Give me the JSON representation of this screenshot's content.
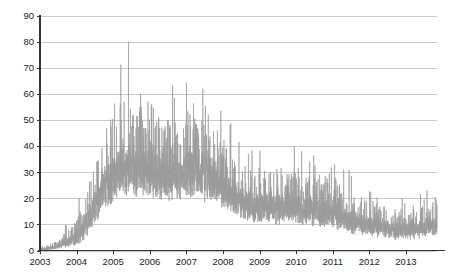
{
  "chart_data": {
    "type": "line",
    "title": "",
    "xlabel": "",
    "ylabel": "",
    "ylim": [
      0,
      90
    ],
    "xlim": [
      2003.0,
      2013.85
    ],
    "grid": true,
    "grid_axis": "y",
    "legend": "none",
    "series_color": "#9a9a9a",
    "axis_color": "#333333",
    "grid_color": "#c8c8c8",
    "background": "#ffffff",
    "y_ticks": [
      0,
      10,
      20,
      30,
      40,
      50,
      60,
      70,
      80,
      90
    ],
    "y_tick_labels": [
      "0",
      "10",
      "20",
      "30",
      "40",
      "50",
      "60",
      "70",
      "80",
      "90"
    ],
    "x_ticks": [
      2003,
      2004,
      2005,
      2006,
      2007,
      2008,
      2009,
      2010,
      2011,
      2012,
      2013
    ],
    "x_tick_labels": [
      "2003",
      "2004",
      "2005",
      "2006",
      "2007",
      "2008",
      "2009",
      "2010",
      "2011",
      "2012",
      "2013"
    ],
    "series": [
      {
        "name": "series-1",
        "color": "#9a9a9a",
        "description": "Dense noisy daily time series with sharp vertical spikes",
        "baseline": [
          {
            "x": 2003.0,
            "y": 0.3
          },
          {
            "x": 2003.2,
            "y": 0.6
          },
          {
            "x": 2003.4,
            "y": 1.2
          },
          {
            "x": 2003.6,
            "y": 2.0
          },
          {
            "x": 2003.8,
            "y": 3.2
          },
          {
            "x": 2004.0,
            "y": 5.0
          },
          {
            "x": 2004.2,
            "y": 8.0
          },
          {
            "x": 2004.4,
            "y": 13.0
          },
          {
            "x": 2004.6,
            "y": 19.0
          },
          {
            "x": 2004.8,
            "y": 24.0
          },
          {
            "x": 2005.0,
            "y": 27.0
          },
          {
            "x": 2005.2,
            "y": 29.0
          },
          {
            "x": 2005.4,
            "y": 30.0
          },
          {
            "x": 2005.6,
            "y": 30.0
          },
          {
            "x": 2005.8,
            "y": 29.5
          },
          {
            "x": 2006.0,
            "y": 29.0
          },
          {
            "x": 2006.2,
            "y": 28.0
          },
          {
            "x": 2006.4,
            "y": 27.5
          },
          {
            "x": 2006.6,
            "y": 27.0
          },
          {
            "x": 2006.8,
            "y": 27.5
          },
          {
            "x": 2007.0,
            "y": 28.0
          },
          {
            "x": 2007.2,
            "y": 28.5
          },
          {
            "x": 2007.4,
            "y": 28.0
          },
          {
            "x": 2007.6,
            "y": 27.0
          },
          {
            "x": 2007.8,
            "y": 25.0
          },
          {
            "x": 2008.0,
            "y": 23.0
          },
          {
            "x": 2008.2,
            "y": 21.0
          },
          {
            "x": 2008.4,
            "y": 19.0
          },
          {
            "x": 2008.6,
            "y": 17.5
          },
          {
            "x": 2008.8,
            "y": 16.5
          },
          {
            "x": 2009.0,
            "y": 16.0
          },
          {
            "x": 2009.2,
            "y": 16.0
          },
          {
            "x": 2009.4,
            "y": 16.0
          },
          {
            "x": 2009.6,
            "y": 15.5
          },
          {
            "x": 2009.8,
            "y": 15.5
          },
          {
            "x": 2010.0,
            "y": 15.5
          },
          {
            "x": 2010.2,
            "y": 15.0
          },
          {
            "x": 2010.4,
            "y": 14.5
          },
          {
            "x": 2010.6,
            "y": 14.0
          },
          {
            "x": 2010.8,
            "y": 13.5
          },
          {
            "x": 2011.0,
            "y": 13.0
          },
          {
            "x": 2011.2,
            "y": 12.0
          },
          {
            "x": 2011.4,
            "y": 11.0
          },
          {
            "x": 2011.6,
            "y": 10.0
          },
          {
            "x": 2011.8,
            "y": 9.5
          },
          {
            "x": 2012.0,
            "y": 9.0
          },
          {
            "x": 2012.2,
            "y": 8.5
          },
          {
            "x": 2012.4,
            "y": 8.0
          },
          {
            "x": 2012.6,
            "y": 7.5
          },
          {
            "x": 2012.8,
            "y": 7.0
          },
          {
            "x": 2013.0,
            "y": 7.0
          },
          {
            "x": 2013.2,
            "y": 7.5
          },
          {
            "x": 2013.4,
            "y": 8.0
          },
          {
            "x": 2013.6,
            "y": 8.5
          },
          {
            "x": 2013.85,
            "y": 9.0
          }
        ],
        "noise_amplitude": [
          {
            "x": 2003.0,
            "a": 0.4
          },
          {
            "x": 2003.5,
            "a": 1.2
          },
          {
            "x": 2004.0,
            "a": 4.0
          },
          {
            "x": 2004.5,
            "a": 9.0
          },
          {
            "x": 2005.0,
            "a": 13.0
          },
          {
            "x": 2005.5,
            "a": 14.0
          },
          {
            "x": 2006.0,
            "a": 13.0
          },
          {
            "x": 2006.5,
            "a": 12.0
          },
          {
            "x": 2007.0,
            "a": 12.5
          },
          {
            "x": 2007.5,
            "a": 13.0
          },
          {
            "x": 2008.0,
            "a": 10.0
          },
          {
            "x": 2008.5,
            "a": 8.0
          },
          {
            "x": 2009.0,
            "a": 8.0
          },
          {
            "x": 2009.5,
            "a": 8.5
          },
          {
            "x": 2010.0,
            "a": 8.0
          },
          {
            "x": 2010.5,
            "a": 7.5
          },
          {
            "x": 2011.0,
            "a": 7.0
          },
          {
            "x": 2011.5,
            "a": 6.0
          },
          {
            "x": 2012.0,
            "a": 5.0
          },
          {
            "x": 2012.5,
            "a": 4.5
          },
          {
            "x": 2013.0,
            "a": 4.5
          },
          {
            "x": 2013.85,
            "a": 5.0
          }
        ],
        "notable_peaks": [
          {
            "x": 2005.42,
            "y": 80.0,
            "note": "maximum spike"
          },
          {
            "x": 2005.3,
            "y": 57.0
          },
          {
            "x": 2005.55,
            "y": 52.0
          },
          {
            "x": 2005.75,
            "y": 60.0
          },
          {
            "x": 2005.95,
            "y": 57.0
          },
          {
            "x": 2006.55,
            "y": 48.0
          },
          {
            "x": 2007.45,
            "y": 62.0,
            "note": "secondary peak"
          },
          {
            "x": 2007.6,
            "y": 52.0
          },
          {
            "x": 2007.85,
            "y": 46.0
          },
          {
            "x": 2009.95,
            "y": 40.0
          },
          {
            "x": 2010.15,
            "y": 38.0
          },
          {
            "x": 2011.05,
            "y": 33.0
          },
          {
            "x": 2011.3,
            "y": 31.0
          }
        ],
        "observed_range": {
          "min": 0,
          "max": 80
        }
      }
    ]
  }
}
